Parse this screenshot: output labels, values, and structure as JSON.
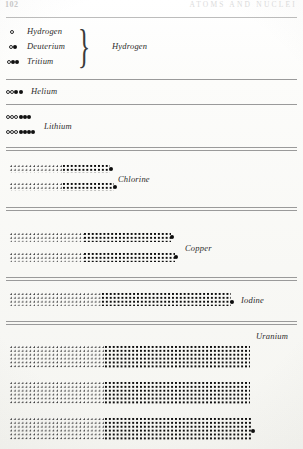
{
  "page": {
    "folio": "102",
    "running_title": "ATOMS AND NUCLEI"
  },
  "figure": {
    "caption_note": "",
    "legend": {
      "proton_symbol": "open circle",
      "neutron_symbol": "filled circle"
    }
  },
  "sections": [
    {
      "id": "hydrogen-group",
      "group_label": "Hydrogen",
      "isotopes": [
        {
          "name": "Hydrogen",
          "protons": 1,
          "neutrons": 0
        },
        {
          "name": "Deuterium",
          "protons": 1,
          "neutrons": 1
        },
        {
          "name": "Tritium",
          "protons": 1,
          "neutrons": 2
        }
      ]
    },
    {
      "id": "helium",
      "group_label": "Helium",
      "isotopes": [
        {
          "name": "Helium",
          "protons": 2,
          "neutrons": 2
        }
      ]
    },
    {
      "id": "lithium",
      "group_label": "Lithium",
      "isotopes": [
        {
          "name": "Lithium",
          "protons": 3,
          "neutrons": 3
        },
        {
          "name": "Lithium",
          "protons": 3,
          "neutrons": 4
        }
      ]
    },
    {
      "id": "chlorine",
      "group_label": "Chlorine",
      "isotopes": [
        {
          "name": "Chlorine",
          "protons": 17,
          "neutrons": 18
        },
        {
          "name": "Chlorine",
          "protons": 17,
          "neutrons": 20
        }
      ]
    },
    {
      "id": "copper",
      "group_label": "Copper",
      "isotopes": [
        {
          "name": "Copper",
          "protons": 29,
          "neutrons": 34
        },
        {
          "name": "Copper",
          "protons": 29,
          "neutrons": 36
        }
      ]
    },
    {
      "id": "iodine",
      "group_label": "Iodine",
      "isotopes": [
        {
          "name": "Iodine",
          "protons": 53,
          "neutrons": 74
        }
      ]
    },
    {
      "id": "uranium",
      "group_label": "Uranium",
      "isotopes": [
        {
          "name": "Uranium",
          "protons": 92,
          "neutrons": 142
        },
        {
          "name": "Uranium",
          "protons": 92,
          "neutrons": 143
        },
        {
          "name": "Uranium",
          "protons": 92,
          "neutrons": 146
        }
      ]
    }
  ],
  "labels": {
    "hydrogen": "Hydrogen",
    "deuterium": "Deuterium",
    "tritium": "Tritium",
    "hydrogen_group": "Hydrogen",
    "helium": "Helium",
    "lithium": "Lithium",
    "chlorine": "Chlorine",
    "copper": "Copper",
    "iodine": "Iodine",
    "uranium": "Uranium"
  },
  "colors": {
    "ink": "#111111",
    "paper": "#fbfbf9",
    "rule": "#9a9a9a",
    "faded_header": "#dcdcdc"
  }
}
